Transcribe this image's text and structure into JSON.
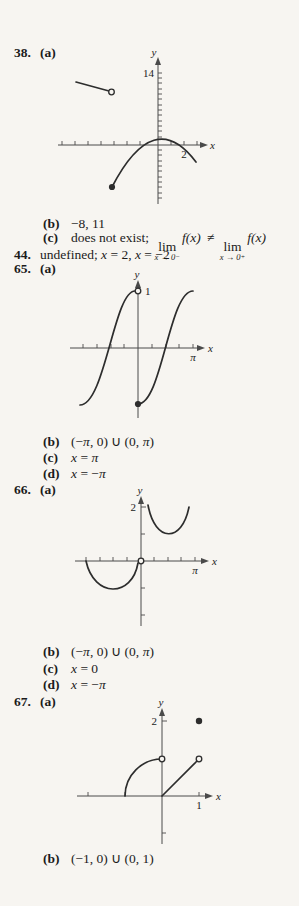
{
  "p38": {
    "number": "38.",
    "part": "(a)",
    "graph": {
      "y_axis": "y",
      "x_axis": "x",
      "y_tick_14": "14",
      "x_tick_2": "2"
    },
    "b": {
      "label": "(b)",
      "text": "−8, 11"
    },
    "c": {
      "label": "(c)",
      "prefix": "does not exist;",
      "lim_word": "lim",
      "sub1": "x → 0",
      "sign1": "−",
      "fx1": "f(x)",
      "neq": "≠",
      "sub2": "x → 0",
      "sign2": "+",
      "fx2": "f(x)"
    }
  },
  "p44": {
    "number": "44.",
    "seg1": "undefined; ",
    "x1": "x",
    "seg2": " = 2, ",
    "x2": "x",
    "seg3": " = −2"
  },
  "p65": {
    "number": "65.",
    "part": "(a)",
    "graph": {
      "y_axis": "y",
      "x_axis": "x",
      "y_tick_1": "1",
      "pi": "π"
    },
    "b": {
      "label": "(b)",
      "s1": "(−",
      "pi1": "π",
      "s2": ", 0) ∪ (0, ",
      "pi2": "π",
      "s3": ")"
    },
    "c": {
      "label": "(c)",
      "x": "x",
      "eq": " = ",
      "pi": "π"
    },
    "d": {
      "label": "(d)",
      "x": "x",
      "eq": " = −",
      "pi": "π"
    }
  },
  "p66": {
    "number": "66.",
    "part": "(a)",
    "graph": {
      "y_axis": "y",
      "x_axis": "x",
      "y_tick_2": "2",
      "pi": "π"
    },
    "b": {
      "label": "(b)",
      "s1": "(−",
      "pi1": "π",
      "s2": ", 0) ∪ (0, ",
      "pi2": "π",
      "s3": ")"
    },
    "c": {
      "label": "(c)",
      "x": "x",
      "eq": " = 0"
    },
    "d": {
      "label": "(d)",
      "x": "x",
      "eq": " = −",
      "pi": "π"
    }
  },
  "p67": {
    "number": "67.",
    "part": "(a)",
    "graph": {
      "y_axis": "y",
      "x_axis": "x",
      "y_tick_2": "2",
      "x_tick_1": "1"
    },
    "b": {
      "label": "(b)",
      "text": "(−1, 0) ∪ (0, 1)"
    }
  }
}
